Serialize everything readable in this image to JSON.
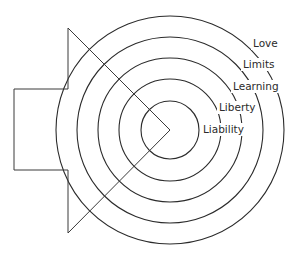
{
  "diagram": {
    "type": "concentric-circles",
    "center": {
      "x": 170,
      "y": 130
    },
    "colors": {
      "stroke": "#2b2b2b",
      "background": "#ffffff"
    },
    "rings": [
      {
        "label": "Liability",
        "radius": 29,
        "label_x": 203,
        "label_y": 133
      },
      {
        "label": "Liberty",
        "radius": 51,
        "label_x": 219,
        "label_y": 111
      },
      {
        "label": "Learning",
        "radius": 72,
        "label_x": 233,
        "label_y": 90
      },
      {
        "label": "Limits",
        "radius": 93,
        "label_x": 243,
        "label_y": 68
      },
      {
        "label": "Love",
        "radius": 114,
        "label_x": 253,
        "label_y": 47
      }
    ],
    "pointer_shape": {
      "description": "speaker/arrow shape pointing into the center",
      "rect": {
        "x": 14,
        "y": 89,
        "w": 54,
        "h": 81
      },
      "triangle_top": {
        "x": 68,
        "y": 28
      },
      "triangle_bottom": {
        "x": 68,
        "y": 233
      }
    }
  }
}
